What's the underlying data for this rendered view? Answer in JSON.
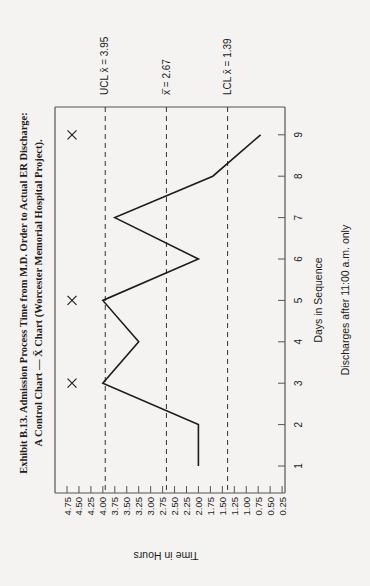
{
  "title": {
    "line1": "Exhibit B.13. Admission Process Time from M.D. Order to Actual ER Discharge:",
    "line2": "A Control Chart — X̄ Chart (Worcester Memorial Hospital Project)."
  },
  "labels": {
    "ucl": "UCL x̄ = 3.95",
    "mean": "x̄̄ = 2.67",
    "lcl": "LCL x̄ = 1.39",
    "ylabel": "Time in Hours",
    "xlabel": "Days in Sequence",
    "note": "Discharges after 11:00 a.m. only"
  },
  "colors": {
    "background": "#f4f3f1",
    "ink": "#1c1c1c",
    "axis": "#555555"
  },
  "chart_data": {
    "type": "line",
    "title": "Exhibit B.13. Admission Process Time from M.D. Order to Actual ER Discharge: A Control Chart — X̄ Chart (Worcester Memorial Hospital Project).",
    "xlabel": "Days in Sequence",
    "ylabel": "Time in Hours",
    "subtitle": "Discharges after 11:00 a.m. only",
    "orientation": "rotated 90° clockwise on page",
    "x": [
      1,
      2,
      3,
      4,
      5,
      6,
      7,
      8,
      9
    ],
    "series": [
      {
        "name": "X̄ (daily mean)",
        "values": [
          2.0,
          2.0,
          4.0,
          3.25,
          4.0,
          2.0,
          3.75,
          1.7,
          0.7
        ]
      }
    ],
    "control_limits": [
      {
        "name": "UCL",
        "value": 3.95,
        "style": "dashed"
      },
      {
        "name": "Mean (X double bar)",
        "value": 2.67,
        "style": "dashed"
      },
      {
        "name": "LCL",
        "value": 1.39,
        "style": "dashed"
      }
    ],
    "out_of_control_markers": [
      {
        "day": 3,
        "marker": "X"
      },
      {
        "day": 5,
        "marker": "X"
      },
      {
        "day": 9,
        "marker": "X"
      }
    ],
    "yticks": [
      "4.75",
      "4.50",
      "4.25",
      "4.00",
      "3.75",
      "3.50",
      "3.25",
      "3.00",
      "2.75",
      "2.50",
      "2.25",
      "2.00",
      "1.75",
      "1.50",
      "1.25",
      "1.00",
      "0.75",
      "0.50",
      "0.25"
    ],
    "xticks": [
      "1",
      "2",
      "3",
      "4",
      "5",
      "6",
      "7",
      "8",
      "9"
    ],
    "ylim": [
      0.25,
      4.75
    ],
    "xlim": [
      0.5,
      9.8
    ],
    "grid": false,
    "legend": "none"
  }
}
